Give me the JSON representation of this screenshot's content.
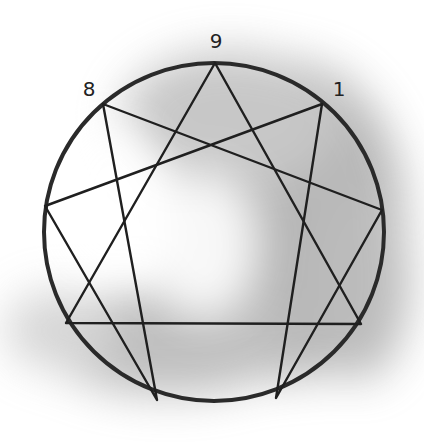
{
  "diagram": {
    "type": "enneagram",
    "colors": {
      "stroke": "#2a2a2a",
      "shade": "#8a8a8a",
      "background": "#ffffff"
    },
    "circle": {
      "cx": 214,
      "cy": 232,
      "rx": 170,
      "ry": 169
    },
    "labels": [
      {
        "text": "9",
        "x": 216,
        "y": 48
      },
      {
        "text": "8",
        "x": 89,
        "y": 96
      },
      {
        "text": "1",
        "x": 339,
        "y": 96
      }
    ],
    "vertices": {
      "9": [
        215,
        63
      ],
      "1": [
        322,
        104
      ],
      "2": [
        382,
        210
      ],
      "3": [
        361,
        324
      ],
      "4": [
        276,
        398
      ],
      "5": [
        157,
        400
      ],
      "6": [
        66,
        323
      ],
      "7": [
        45,
        206
      ],
      "8": [
        103,
        104
      ]
    },
    "triangle": [
      "9",
      "3",
      "6"
    ],
    "hexad": [
      "1",
      "4",
      "2",
      "8",
      "5",
      "7"
    ]
  }
}
